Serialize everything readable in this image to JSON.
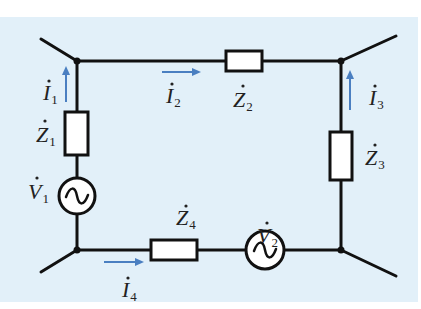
{
  "diagram": {
    "type": "circuit",
    "background_color": "#e2f0f9",
    "wire_color": "#111111",
    "arrow_color": "#4a7fc1",
    "impedances": [
      {
        "id": "Z1",
        "symbol": "Z",
        "subscript": "1"
      },
      {
        "id": "Z2",
        "symbol": "Z",
        "subscript": "2"
      },
      {
        "id": "Z3",
        "symbol": "Z",
        "subscript": "3"
      },
      {
        "id": "Z4",
        "symbol": "Z",
        "subscript": "4"
      }
    ],
    "sources": [
      {
        "id": "V1",
        "symbol": "V",
        "subscript": "1",
        "glyph": "~"
      },
      {
        "id": "V2",
        "symbol": "V",
        "subscript": "2",
        "glyph": "~"
      }
    ],
    "currents": [
      {
        "id": "I1",
        "symbol": "I",
        "subscript": "1",
        "direction": "up"
      },
      {
        "id": "I2",
        "symbol": "I",
        "subscript": "2",
        "direction": "right"
      },
      {
        "id": "I3",
        "symbol": "I",
        "subscript": "3",
        "direction": "up"
      },
      {
        "id": "I4",
        "symbol": "I",
        "subscript": "4",
        "direction": "right"
      }
    ],
    "nodes": 4
  }
}
